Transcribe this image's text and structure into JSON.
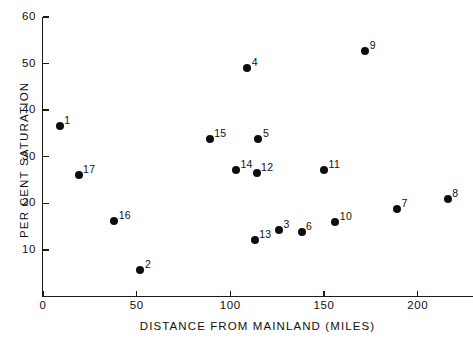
{
  "chart_data": {
    "type": "scatter",
    "title": "",
    "xlabel": "DISTANCE FROM MAINLAND (MILES)",
    "ylabel": "PER CENT SATURATION",
    "xlim": [
      0,
      229
    ],
    "ylim": [
      0,
      60
    ],
    "grid": false,
    "legend": "none",
    "xticks": [
      0,
      50,
      100,
      150,
      200
    ],
    "xtick_labels": [
      "0",
      "50",
      "100",
      "150",
      "200"
    ],
    "yticks": [
      10,
      20,
      30,
      40,
      50,
      60
    ],
    "ytick_labels": [
      "10",
      "20",
      "30",
      "40",
      "50",
      "60"
    ],
    "point_marker": "filled-circle",
    "point_color": "#0d0d0d",
    "axis_color": "#1a1a1a",
    "background_color": "#ffffff",
    "points": [
      {
        "label": "1",
        "x": 9,
        "y": 36.6,
        "label_pos": "upper-right"
      },
      {
        "label": "17",
        "x": 19,
        "y": 26.1,
        "label_pos": "upper-right"
      },
      {
        "label": "16",
        "x": 38,
        "y": 16.2,
        "label_pos": "upper-right"
      },
      {
        "label": "2",
        "x": 52,
        "y": 5.6,
        "label_pos": "upper-right"
      },
      {
        "label": "15",
        "x": 89,
        "y": 33.8,
        "label_pos": "upper-right"
      },
      {
        "label": "14",
        "x": 103,
        "y": 27.2,
        "label_pos": "upper-right"
      },
      {
        "label": "4",
        "x": 109,
        "y": 49.1,
        "label_pos": "upper-right"
      },
      {
        "label": "13",
        "x": 113,
        "y": 12.2,
        "label_pos": "upper-right"
      },
      {
        "label": "12",
        "x": 114,
        "y": 26.5,
        "label_pos": "upper-right"
      },
      {
        "label": "5",
        "x": 115,
        "y": 33.9,
        "label_pos": "upper-right"
      },
      {
        "label": "3",
        "x": 126,
        "y": 14.2,
        "label_pos": "upper-right"
      },
      {
        "label": "6",
        "x": 138,
        "y": 13.9,
        "label_pos": "upper-right"
      },
      {
        "label": "11",
        "x": 150,
        "y": 27.1,
        "label_pos": "upper-right"
      },
      {
        "label": "10",
        "x": 156,
        "y": 16.1,
        "label_pos": "upper-right"
      },
      {
        "label": "9",
        "x": 172,
        "y": 52.7,
        "label_pos": "upper-right"
      },
      {
        "label": "7",
        "x": 189,
        "y": 18.7,
        "label_pos": "upper-right"
      },
      {
        "label": "8",
        "x": 216,
        "y": 20.9,
        "label_pos": "upper-right"
      }
    ]
  }
}
